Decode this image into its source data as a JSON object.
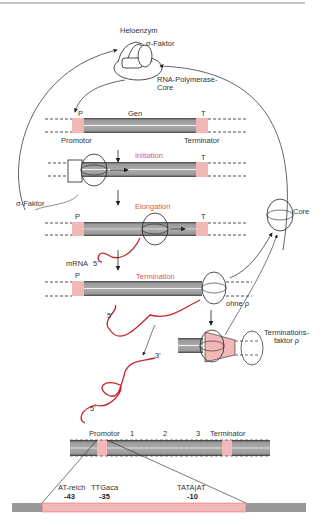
{
  "diagram": {
    "title_top": "Heloenzym",
    "labels": {
      "sigma_factor_top": "σ-Faktor",
      "rna_polymerase_core": "RNA-Polymerase-\nCore",
      "p": "P",
      "gen": "Gen",
      "t": "T",
      "promotor": "Promotor",
      "terminator": "Terminator",
      "sigma_factor_left": "σ-Faktor",
      "core": "Core",
      "mrna": "mRNA",
      "five_prime": "5'",
      "three_prime": "3'",
      "ohne_rho": "ohne ρ",
      "terminationsfaktor": "Terminations-\nfaktor ρ"
    },
    "stages": [
      {
        "name": "Initiation"
      },
      {
        "name": "Elongation"
      },
      {
        "name": "Termination"
      }
    ],
    "gene_map": {
      "promotor": "Promotor",
      "segments": [
        "1",
        "2",
        "3"
      ],
      "terminator": "Terminator"
    },
    "promoter_detail": [
      {
        "seq": "AT-reich",
        "pos": "-43"
      },
      {
        "seq": "TTGaca",
        "pos": "-35"
      },
      {
        "seq": "TATA|AT",
        "pos": "-10"
      }
    ],
    "colors": {
      "highlight": "#d9585a",
      "pink_region": "#f2b8b8",
      "dna_gray": "#8a8a8a",
      "rna_red": "#c8262a"
    }
  }
}
